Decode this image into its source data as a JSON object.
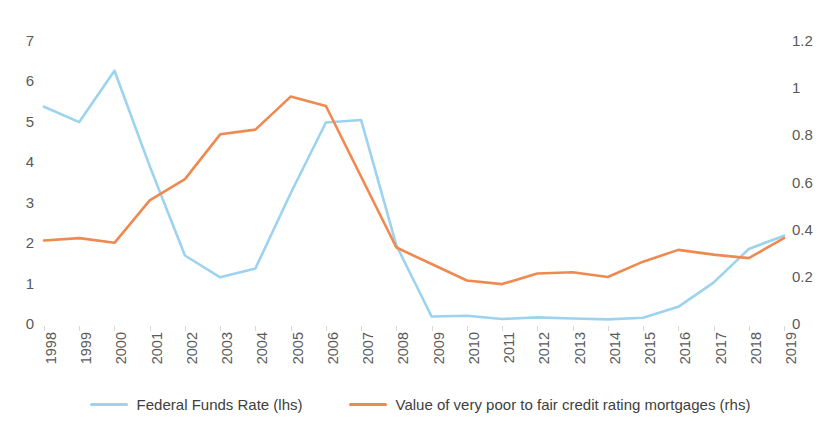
{
  "chart_data": {
    "type": "line",
    "title": "",
    "subtitle": "",
    "xlabel": "",
    "ylabel": "",
    "grid": false,
    "legend_position": "bottom",
    "categories": [
      "1998",
      "1999",
      "2000",
      "2001",
      "2002",
      "2003",
      "2004",
      "2005",
      "2006",
      "2007",
      "2008",
      "2009",
      "2010",
      "2011",
      "2012",
      "2013",
      "2014",
      "2015",
      "2016",
      "2017",
      "2018",
      "2019"
    ],
    "axes": {
      "left": {
        "label": "",
        "ylim": [
          0,
          7
        ],
        "ticks": [
          "0",
          "1",
          "2",
          "3",
          "4",
          "5",
          "6",
          "7"
        ],
        "tick_values": [
          0,
          1,
          2,
          3,
          4,
          5,
          6,
          7
        ]
      },
      "right": {
        "label": "",
        "ylim": [
          0,
          1.2
        ],
        "ticks": [
          "0",
          "0.2",
          "0.4",
          "0.6",
          "0.8",
          "1",
          "1.2"
        ],
        "tick_values": [
          0,
          0.2,
          0.4,
          0.6,
          0.8,
          1,
          1.2
        ]
      }
    },
    "series": [
      {
        "name": "Federal Funds Rate (lhs)",
        "axis": "left",
        "color": "#9dd3ef",
        "values": [
          5.35,
          4.97,
          6.24,
          3.88,
          1.67,
          1.13,
          1.35,
          3.21,
          4.96,
          5.02,
          1.92,
          0.16,
          0.18,
          0.1,
          0.14,
          0.11,
          0.09,
          0.13,
          0.4,
          1.0,
          1.83,
          2.16
        ]
      },
      {
        "name": "Value of very poor to fair credit rating mortgages (rhs)",
        "axis": "right",
        "color": "#ee8a4f",
        "values": [
          0.35,
          0.36,
          0.34,
          0.52,
          0.61,
          0.8,
          0.82,
          0.96,
          0.92,
          0.62,
          0.32,
          0.25,
          0.18,
          0.165,
          0.21,
          0.215,
          0.195,
          0.26,
          0.31,
          0.29,
          0.275,
          0.36
        ]
      }
    ]
  },
  "legend": {
    "items": [
      {
        "label": "Federal Funds Rate (lhs)",
        "color": "#9dd3ef"
      },
      {
        "label": "Value of very poor to fair credit rating mortgages (rhs)",
        "color": "#ee8a4f"
      }
    ]
  }
}
